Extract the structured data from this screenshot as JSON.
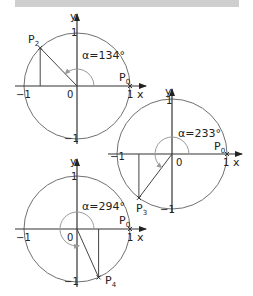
{
  "header_bar": {
    "color": "#cfcfcf"
  },
  "colors": {
    "circle": "#707070",
    "axis": "#333333",
    "angle_arc": "#9a9a9a",
    "radius_line": "#444444"
  },
  "diagrams": [
    {
      "id": "circle-p2",
      "angle_label": "α=134°",
      "angle_deg": 134,
      "point_label": "P",
      "point_sub": "2",
      "start_label": "P",
      "start_sub": "0",
      "axis_x": "x",
      "axis_y": "y",
      "origin": "0",
      "tick_pos": "1",
      "tick_neg": "−1"
    },
    {
      "id": "circle-p3",
      "angle_label": "α=233°",
      "angle_deg": 233,
      "point_label": "P",
      "point_sub": "3",
      "start_label": "P",
      "start_sub": "0",
      "axis_x": "x",
      "axis_y": "y",
      "origin": "0",
      "tick_pos": "1",
      "tick_neg": "−1"
    },
    {
      "id": "circle-p4",
      "angle_label": "α=294°",
      "angle_deg": 294,
      "point_label": "P",
      "point_sub": "4",
      "start_label": "P",
      "start_sub": "0",
      "axis_x": "x",
      "axis_y": "y",
      "origin": "0",
      "tick_pos": "1",
      "tick_neg": "−1"
    }
  ]
}
